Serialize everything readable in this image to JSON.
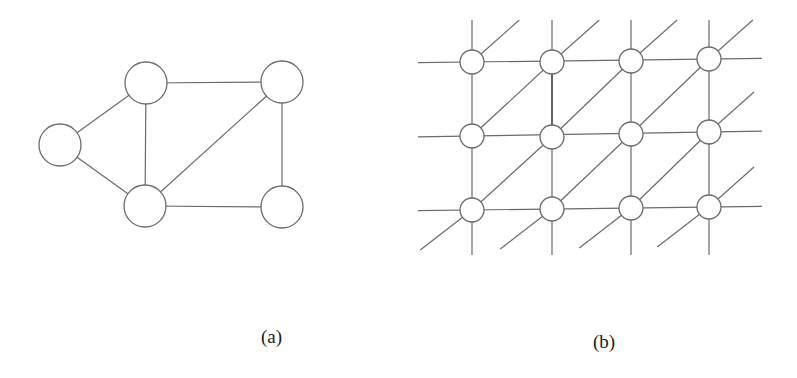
{
  "figure": {
    "width": 797,
    "height": 378,
    "colors": {
      "background": "#ffffff",
      "edge": "#6b6b6b",
      "node_stroke": "#6b6b6b",
      "node_fill": "#ffffff",
      "text": "#222222"
    }
  },
  "panel_a": {
    "caption": "(a)",
    "node_radius": 21,
    "nodes": [
      {
        "id": "left",
        "x": 60,
        "y": 145
      },
      {
        "id": "top-left",
        "x": 146,
        "y": 83
      },
      {
        "id": "top-right",
        "x": 282,
        "y": 82
      },
      {
        "id": "bottom-left",
        "x": 145,
        "y": 206
      },
      {
        "id": "bottom-right",
        "x": 282,
        "y": 207
      }
    ],
    "edges": [
      [
        "left",
        "top-left"
      ],
      [
        "left",
        "bottom-left"
      ],
      [
        "top-left",
        "top-right"
      ],
      [
        "top-left",
        "bottom-left"
      ],
      [
        "bottom-left",
        "top-right"
      ],
      [
        "bottom-left",
        "bottom-right"
      ],
      [
        "top-right",
        "bottom-right"
      ]
    ]
  },
  "panel_b": {
    "caption": "(b)",
    "node_radius": 12,
    "columns": [
      472,
      552,
      631,
      709
    ],
    "rows": [
      [
        62,
        62,
        61,
        59
      ],
      [
        136,
        137,
        134,
        132
      ],
      [
        210,
        209,
        208,
        207
      ]
    ],
    "horizontal_extent": {
      "left": 418,
      "right": 762
    },
    "vertical_extent": {
      "top": 20,
      "bottom": 255
    },
    "diagonal_stub": {
      "dx": 45,
      "dy": -40
    },
    "emphasized_edge": {
      "from": [
        1,
        0
      ],
      "to": [
        1,
        1
      ]
    }
  }
}
